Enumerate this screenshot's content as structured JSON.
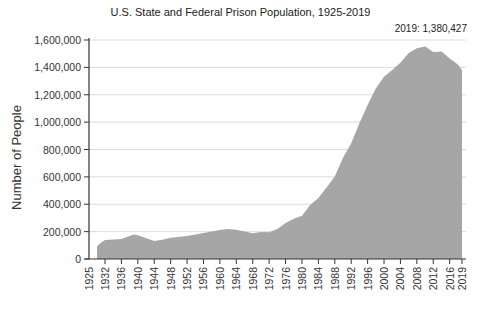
{
  "chart_data": {
    "type": "area",
    "title": "U.S. State and Federal Prison Population, 1925-2019",
    "xlabel": "",
    "ylabel": "Number of People",
    "ylim": [
      0,
      1600000
    ],
    "yticks": [
      0,
      200000,
      400000,
      600000,
      800000,
      1000000,
      1200000,
      1400000,
      1600000
    ],
    "ytick_labels": [
      "0",
      "200,000",
      "400,000",
      "600,000",
      "800,000",
      "1,000,000",
      "1,200,000",
      "1,400,000",
      "1,600,000"
    ],
    "xtick_labels": [
      "1925",
      "1932",
      "1936",
      "1940",
      "1944",
      "1948",
      "1952",
      "1956",
      "1960",
      "1964",
      "1968",
      "1972",
      "1976",
      "1980",
      "1984",
      "1988",
      "1992",
      "1996",
      "2000",
      "2004",
      "2008",
      "2012",
      "2016",
      "2019"
    ],
    "annotation": "2019: 1,380,427",
    "grid": true,
    "fill_color": "#a6a6a6",
    "x": [
      1925,
      1928,
      1932,
      1936,
      1939,
      1940,
      1944,
      1946,
      1948,
      1952,
      1956,
      1960,
      1962,
      1964,
      1968,
      1970,
      1972,
      1974,
      1976,
      1978,
      1980,
      1982,
      1984,
      1986,
      1988,
      1990,
      1992,
      1994,
      1996,
      1998,
      2000,
      2002,
      2004,
      2006,
      2008,
      2010,
      2012,
      2014,
      2016,
      2018,
      2019
    ],
    "values": [
      91669,
      116390,
      137997,
      145038,
      179818,
      173706,
      132456,
      140079,
      155977,
      168233,
      189565,
      212953,
      218830,
      214336,
      187914,
      196441,
      196092,
      218466,
      262833,
      294396,
      315974,
      394380,
      444584,
      522084,
      603732,
      739980,
      846277,
      991612,
      1125874,
      1245402,
      1331278,
      1380516,
      1433728,
      1504660,
      1540036,
      1552669,
      1512430,
      1515886,
      1465854,
      1420565,
      1380427
    ]
  },
  "header": {
    "title": "U.S. State and Federal Prison Population, 1925-2019",
    "annotation": "2019: 1,380,427"
  },
  "axes": {
    "ylabel": "Number of People"
  }
}
